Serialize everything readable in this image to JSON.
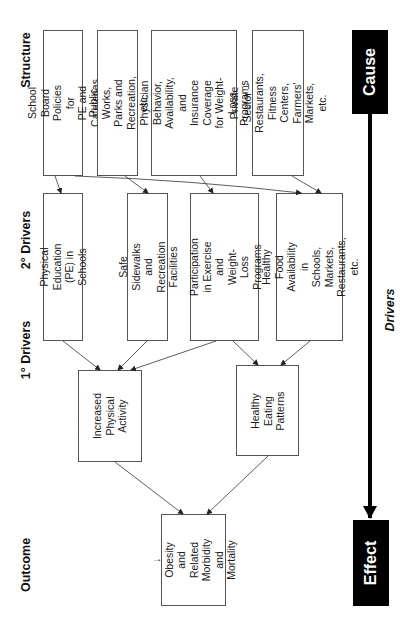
{
  "headings": {
    "structure": "Structure",
    "secondary_drivers": "2° Drivers",
    "primary_drivers": "1° Drivers",
    "outcome": "Outcome"
  },
  "structure": [
    {
      "id": "s1",
      "label": "School Board Policies for\nPE and Cafeterias"
    },
    {
      "id": "s2",
      "label": "Public Works, Parks and\nRecreation, etc."
    },
    {
      "id": "s3",
      "label": "Physician Behavior,\nAvailability, and Insurance\nCoverage for Weight-Loss\nPrograms"
    },
    {
      "id": "s4",
      "label": "Private Sector –\nRestaurants, Fitness Centers,\nFarmers' Markets, etc."
    }
  ],
  "secondary_drivers": [
    {
      "id": "d1",
      "label": "Physical Education (PE) in\nSchools"
    },
    {
      "id": "d2",
      "label": "Safe Sidewalks and\nRecreation Facilities"
    },
    {
      "id": "d3",
      "label": "Participation in Exercise and\nWeight-Loss Programs"
    },
    {
      "id": "d4",
      "label": "Healthy Food Availability in\nSchools, Markets,\nRestaurants, etc."
    }
  ],
  "primary_drivers": [
    {
      "id": "p1",
      "label": "Increased\nPhysical Activity"
    },
    {
      "id": "p2",
      "label": "Healthy Eating\nPatterns"
    }
  ],
  "outcome": {
    "id": "o1",
    "label": "↓ Obesity and\nRelated\nMorbidity and\nMortality"
  },
  "axis": {
    "cause": "Cause",
    "effect": "Effect",
    "drivers": "Drivers"
  },
  "edges": [
    [
      "s1",
      "d1"
    ],
    [
      "s1",
      "d4"
    ],
    [
      "s2",
      "d2"
    ],
    [
      "s3",
      "d3"
    ],
    [
      "s4",
      "d4"
    ],
    [
      "d1",
      "p1"
    ],
    [
      "d2",
      "p1"
    ],
    [
      "d3",
      "p1"
    ],
    [
      "d3",
      "p2"
    ],
    [
      "d4",
      "p2"
    ],
    [
      "p1",
      "o1"
    ],
    [
      "p2",
      "o1"
    ]
  ],
  "colors": {
    "box_border": "#555555",
    "arrow": "#333333",
    "axis": "#000000"
  }
}
